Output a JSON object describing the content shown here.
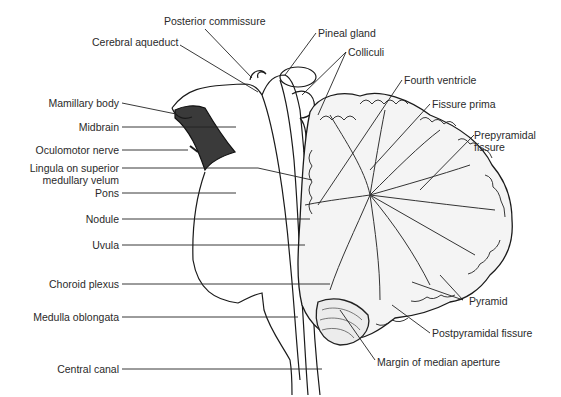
{
  "diagram": {
    "labels_left": [
      {
        "id": "posterior_commissure",
        "text": "Posterior commissure"
      },
      {
        "id": "cerebral_aqueduct",
        "text": "Cerebral aqueduct"
      },
      {
        "id": "mamillary_body",
        "text": "Mamillary body"
      },
      {
        "id": "midbrain",
        "text": "Midbrain"
      },
      {
        "id": "oculomotor_nerve",
        "text": "Oculomotor nerve"
      },
      {
        "id": "lingula_1",
        "text": "Lingula on superior"
      },
      {
        "id": "lingula_2",
        "text": "medullary velum"
      },
      {
        "id": "pons",
        "text": "Pons"
      },
      {
        "id": "nodule",
        "text": "Nodule"
      },
      {
        "id": "uvula",
        "text": "Uvula"
      },
      {
        "id": "choroid_plexus",
        "text": "Choroid plexus"
      },
      {
        "id": "medulla_oblongata",
        "text": "Medulla oblongata"
      },
      {
        "id": "central_canal",
        "text": "Central canal"
      }
    ],
    "labels_right": [
      {
        "id": "pineal_gland",
        "text": "Pineal gland"
      },
      {
        "id": "colliculi",
        "text": "Colliculi"
      },
      {
        "id": "fourth_ventricle",
        "text": "Fourth ventricle"
      },
      {
        "id": "fissure_prima",
        "text": "Fissure prima"
      },
      {
        "id": "prepyramidal_1",
        "text": "Prepyramidal"
      },
      {
        "id": "prepyramidal_2",
        "text": "fissure"
      },
      {
        "id": "pyramid",
        "text": "Pyramid"
      },
      {
        "id": "postpyramidal_fissure",
        "text": "Postpyramidal fissure"
      },
      {
        "id": "margin_median_aperture",
        "text": "Margin of median aperture"
      }
    ]
  }
}
